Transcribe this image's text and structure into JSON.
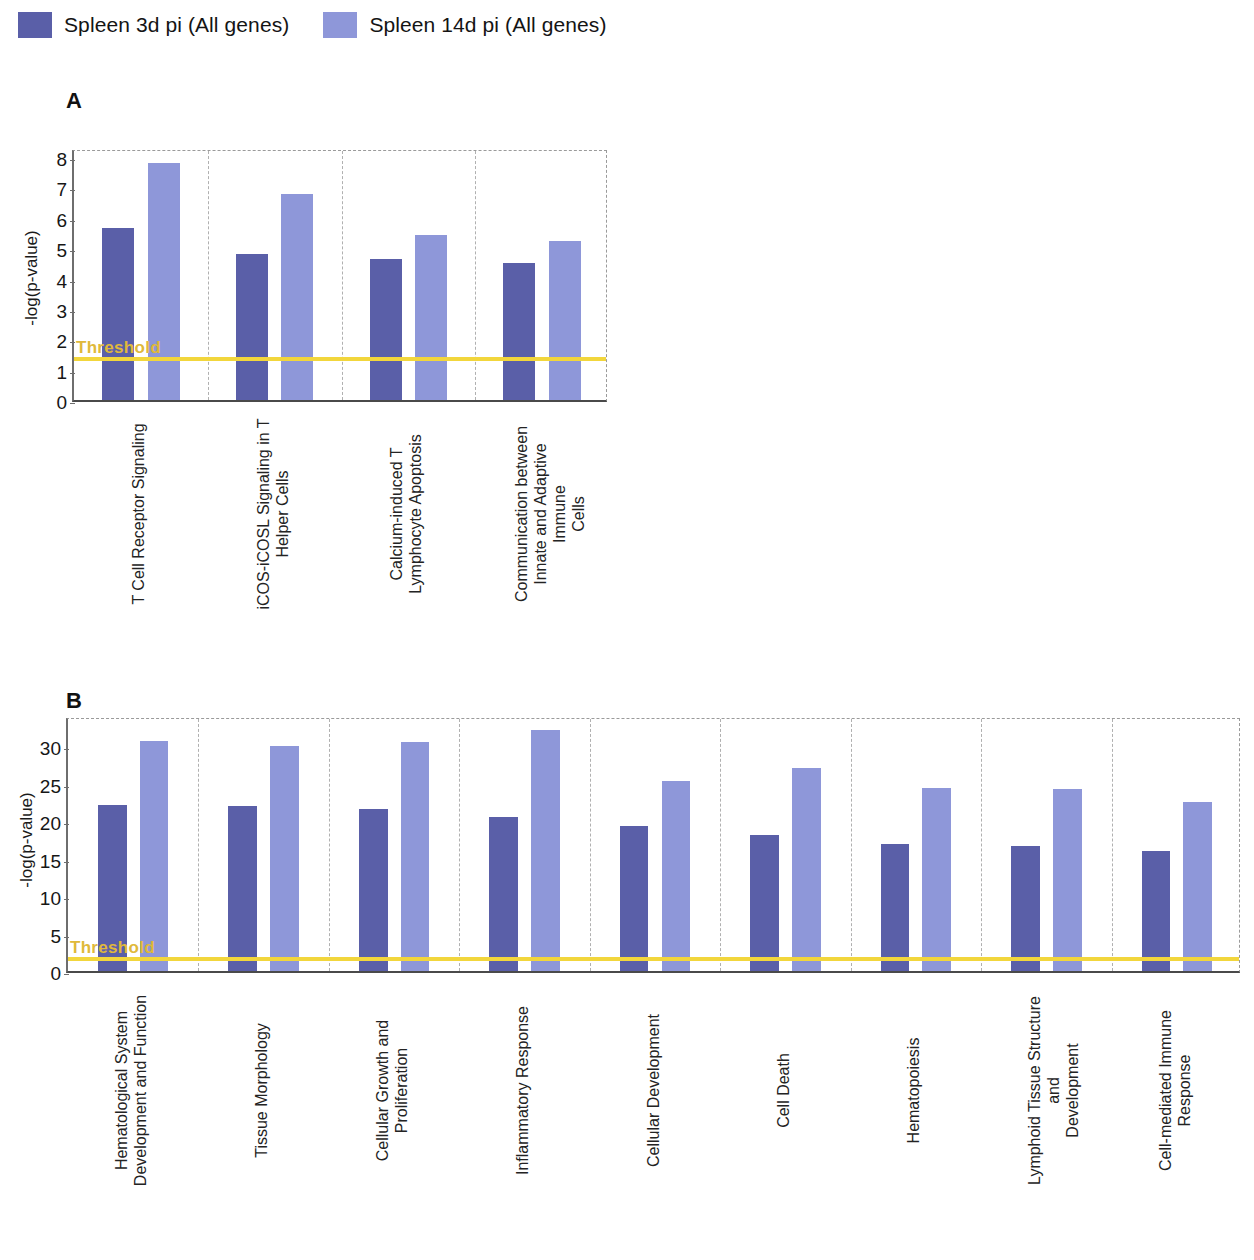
{
  "legend": {
    "items": [
      {
        "label": "Spleen 3d pi (All genes)",
        "color": "#5a5fa8",
        "icon": "legend-swatch-dark"
      },
      {
        "label": "Spleen 14d pi (All genes)",
        "color": "#8e97d9",
        "icon": "legend-swatch-light"
      }
    ]
  },
  "colors": {
    "series_dark": "#5a5fa8",
    "series_light": "#8e97d9",
    "threshold": "#f2d63c",
    "threshold_text": "#e0b93a",
    "axis": "#4a4a4a",
    "gridline": "#b0b0b0"
  },
  "panels": [
    {
      "letter": "A"
    },
    {
      "letter": "B"
    }
  ],
  "chart_data": [
    {
      "type": "bar",
      "panel": "A",
      "title": "",
      "xlabel": "",
      "ylabel": "-log(p-value)",
      "ylim": [
        0,
        8.3
      ],
      "yticks": [
        0,
        1,
        2,
        3,
        4,
        5,
        6,
        7,
        8
      ],
      "ytick_labels": [
        "0",
        "1",
        "2",
        "3",
        "4",
        "5",
        "6",
        "7",
        "8"
      ],
      "grid": "vertical-category-separators",
      "legend_position": "top-left-outside",
      "threshold": {
        "value": 1.3,
        "label": "Threshold"
      },
      "categories": [
        "T Cell Receptor Signaling",
        "iCOS-iCOSL Signaling in T Helper Cells",
        "Calcium-induced T Lymphocyte Apoptosis",
        "Communication between Innate and Adaptive Immune Cells"
      ],
      "category_label_lines": [
        [
          "T Cell Receptor Signaling"
        ],
        [
          "iCOS-iCOSL Signaling in T",
          "Helper Cells"
        ],
        [
          "Calcium-induced T",
          "Lymphocyte Apoptosis"
        ],
        [
          "Communication between",
          "Innate and Adaptive Immune",
          "Cells"
        ]
      ],
      "series": [
        {
          "name": "Spleen 3d pi (All genes)",
          "color": "#5a5fa8",
          "values": [
            5.65,
            4.8,
            4.65,
            4.5
          ]
        },
        {
          "name": "Spleen 14d pi (All genes)",
          "color": "#8e97d9",
          "values": [
            7.8,
            6.8,
            5.45,
            5.25
          ]
        }
      ]
    },
    {
      "type": "bar",
      "panel": "B",
      "title": "",
      "xlabel": "",
      "ylabel": "-log(p-value)",
      "ylim": [
        0,
        34
      ],
      "yticks": [
        0,
        5,
        10,
        15,
        20,
        25,
        30
      ],
      "ytick_labels": [
        "0",
        "5",
        "10",
        "15",
        "20",
        "25",
        "30"
      ],
      "grid": "vertical-category-separators",
      "legend_position": "top-left-outside",
      "threshold": {
        "value": 1.3,
        "label": "Threshold"
      },
      "categories": [
        "Hematological System Development and Function",
        "Tissue Morphology",
        "Cellular Growth and Proliferation",
        "Inflammatory Response",
        "Cellular Development",
        "Cell Death",
        "Hematopoiesis",
        "Lymphoid Tissue Structure and Development",
        "Cell-mediated Immune Response"
      ],
      "category_label_lines": [
        [
          "Hematological System",
          "Development and Function"
        ],
        [
          "Tissue Morphology"
        ],
        [
          "Cellular Growth and",
          "Proliferation"
        ],
        [
          "Inflammatory Response"
        ],
        [
          "Cellular Development"
        ],
        [
          "Cell Death"
        ],
        [
          "Hematopoiesis"
        ],
        [
          "Lymphoid Tissue Structure and",
          "Development"
        ],
        [
          "Cell-mediated Immune",
          "Response"
        ]
      ],
      "series": [
        {
          "name": "Spleen 3d pi (All genes)",
          "color": "#5a5fa8",
          "values": [
            22.2,
            22.0,
            21.6,
            20.5,
            19.3,
            18.1,
            16.9,
            16.7,
            16.0
          ]
        },
        {
          "name": "Spleen 14d pi (All genes)",
          "color": "#8e97d9",
          "values": [
            30.7,
            30.0,
            30.5,
            32.2,
            25.3,
            27.1,
            24.4,
            24.3,
            22.6
          ]
        }
      ]
    }
  ]
}
